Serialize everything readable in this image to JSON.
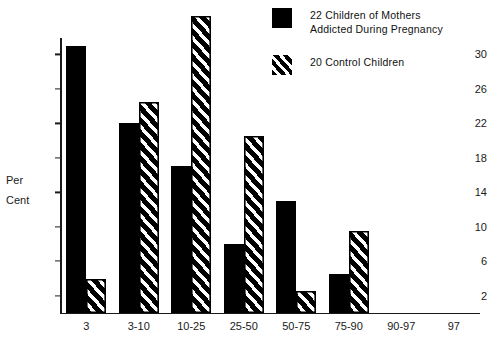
{
  "chart_data": {
    "type": "bar",
    "title": "",
    "xlabel": "",
    "ylabel": "Per\nCent",
    "categories": [
      "3",
      "3-10",
      "10-25",
      "25-50",
      "50-75",
      "75-90",
      "90-97",
      "97"
    ],
    "ylim": [
      0,
      36
    ],
    "yticks": [
      2,
      6,
      10,
      14,
      18,
      22,
      26,
      30
    ],
    "grid": false,
    "legend_position": "top-right",
    "series": [
      {
        "name": "22 Children of Mothers\nAddicted During Pregnancy",
        "style": "solid",
        "color": "#000000",
        "values": [
          31,
          22,
          17,
          8,
          13,
          4.5,
          0,
          0
        ]
      },
      {
        "name": "20 Control Children",
        "style": "hatched",
        "color": "#000000",
        "values": [
          4,
          24.5,
          34.5,
          20.5,
          2.5,
          9.5,
          0,
          0
        ]
      }
    ]
  },
  "legend": {
    "items": [
      {
        "label": "22 Children of Mothers\nAddicted During Pregnancy",
        "swatch": "solid-black-swatch"
      },
      {
        "label": "20 Control Children",
        "swatch": "hatched-black-swatch"
      }
    ]
  },
  "axes": {
    "y_label": "Per\nCent",
    "y_ticks": [
      "2",
      "6",
      "10",
      "14",
      "18",
      "22",
      "26",
      "30"
    ],
    "x_ticks": [
      "3",
      "3-10",
      "10-25",
      "25-50",
      "50-75",
      "75-90",
      "90-97",
      "97"
    ]
  }
}
